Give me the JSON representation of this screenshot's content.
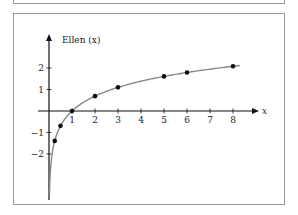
{
  "chart_data": {
    "type": "line",
    "title": "",
    "xlabel": "x",
    "ylabel": "Ellen (x)",
    "x_ticks": [
      1,
      2,
      3,
      4,
      5,
      6,
      7,
      8
    ],
    "y_ticks": [
      -2,
      -1,
      1,
      2
    ],
    "xlim": [
      0,
      9
    ],
    "ylim": [
      -3.5,
      2.8
    ],
    "series": [
      {
        "name": "ln(x) curve",
        "function": "ln(x)",
        "x_range": [
          0.02,
          8.3
        ],
        "color": "#888888"
      },
      {
        "name": "points",
        "type": "scatter",
        "x": [
          0.25,
          0.5,
          1,
          2,
          3,
          5,
          6,
          8
        ],
        "y": [
          -1.39,
          -0.69,
          0,
          0.69,
          1.1,
          1.61,
          1.79,
          2.08
        ],
        "color": "#111111"
      }
    ],
    "grid": false,
    "legend": null
  },
  "labels": {
    "ylabel": "Ellen (x)",
    "xlabel": "x"
  }
}
